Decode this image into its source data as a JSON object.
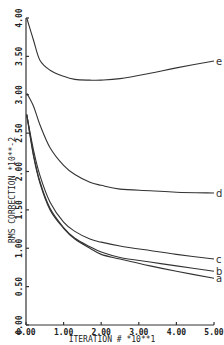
{
  "chart_data": {
    "type": "line",
    "title": "",
    "xlabel": "ITERATION #   *10**1",
    "ylabel": "RMS CORRECTION   *10**-2",
    "xlim": [
      0,
      5
    ],
    "ylim": [
      0,
      4
    ],
    "grid": false,
    "legend_position": "inline labels at right end of curves",
    "x_ticks": [
      "0.00",
      "1.00",
      "2.00",
      "3.00",
      "4.00",
      "5.00"
    ],
    "y_ticks": [
      "0.00",
      "0.50",
      "1.00",
      "1.50",
      "2.00",
      "2.50",
      "3.00",
      "3.50",
      "4.00"
    ],
    "x": [
      0.02,
      0.2,
      0.37,
      0.64,
      1.0,
      1.3,
      1.7,
      2.0,
      2.5,
      3.3,
      4.0,
      5.0
    ],
    "series": [
      {
        "name": "a",
        "values": [
          2.74,
          2.2,
          1.85,
          1.5,
          1.26,
          1.12,
          1.0,
          0.92,
          0.86,
          0.77,
          0.7,
          0.61
        ]
      },
      {
        "name": "b",
        "values": [
          2.74,
          2.22,
          1.87,
          1.52,
          1.27,
          1.13,
          1.02,
          0.95,
          0.88,
          0.82,
          0.77,
          0.7
        ]
      },
      {
        "name": "c",
        "values": [
          2.74,
          2.28,
          1.95,
          1.6,
          1.34,
          1.22,
          1.12,
          1.08,
          1.03,
          0.97,
          0.92,
          0.86
        ]
      },
      {
        "name": "d",
        "values": [
          3.02,
          2.85,
          2.61,
          2.31,
          2.08,
          1.96,
          1.86,
          1.82,
          1.77,
          1.75,
          1.73,
          1.72
        ]
      },
      {
        "name": "e",
        "values": [
          4.0,
          3.71,
          3.45,
          3.32,
          3.24,
          3.2,
          3.19,
          3.19,
          3.21,
          3.28,
          3.35,
          3.44
        ]
      }
    ]
  },
  "plot": {
    "left_px": 26,
    "right_px": 214,
    "top_px": 18,
    "bottom_px": 325
  }
}
